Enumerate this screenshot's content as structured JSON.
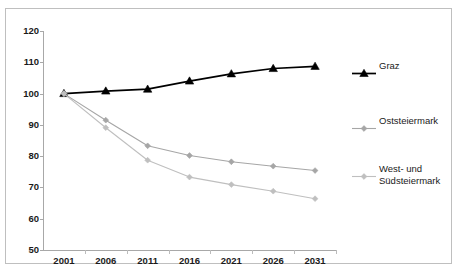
{
  "figure": {
    "title_remnant": "",
    "background": "#ffffff",
    "frame_color": "#bfbfbf"
  },
  "axes": {
    "y_ticks": [
      120,
      110,
      100,
      90,
      80,
      70,
      60,
      50
    ],
    "x_ticks": [
      "2001",
      "2006",
      "2011",
      "2016",
      "2021",
      "2026",
      "2031"
    ],
    "ylim": [
      50,
      120
    ],
    "xlabel": "",
    "ylabel": "",
    "grid": false
  },
  "legend": {
    "position": "right",
    "entries": [
      {
        "label": "Graz",
        "color": "#000000",
        "marker": "triangle"
      },
      {
        "label": "Oststeiermark",
        "color": "#a6a6a6",
        "marker": "diamond"
      },
      {
        "label": "West- und\nSüdsteiermark",
        "color": "#bfbfbf",
        "marker": "diamond"
      }
    ]
  },
  "chart_data": {
    "type": "line",
    "title": "",
    "xlabel": "",
    "ylabel": "",
    "ylim": [
      50,
      120
    ],
    "grid": false,
    "legend_position": "right",
    "categories": [
      "2001",
      "2006",
      "2011",
      "2016",
      "2021",
      "2026",
      "2031"
    ],
    "series": [
      {
        "name": "Graz",
        "color": "#000000",
        "marker": "triangle",
        "values": [
          100.0,
          100.8,
          101.4,
          104.0,
          106.3,
          108.0,
          108.7
        ]
      },
      {
        "name": "Oststeiermark",
        "color": "#a6a6a6",
        "marker": "diamond",
        "values": [
          100.0,
          91.5,
          83.3,
          80.2,
          78.2,
          76.8,
          75.4
        ]
      },
      {
        "name": "West- und Südsteiermark",
        "color": "#bfbfbf",
        "marker": "diamond",
        "values": [
          100.0,
          89.1,
          78.7,
          73.3,
          70.9,
          68.8,
          66.4
        ]
      }
    ]
  }
}
